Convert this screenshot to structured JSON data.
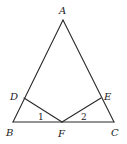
{
  "figure": {
    "type": "geometry-diagram",
    "points": {
      "A": {
        "label": "A"
      },
      "B": {
        "label": "B"
      },
      "C": {
        "label": "C"
      },
      "D": {
        "label": "D"
      },
      "E": {
        "label": "E"
      },
      "F": {
        "label": "F"
      }
    },
    "segments": [
      {
        "name": "AB",
        "from": "A",
        "to": "B"
      },
      {
        "name": "AC",
        "from": "A",
        "to": "C"
      },
      {
        "name": "BC",
        "from": "B",
        "to": "C"
      },
      {
        "name": "DF",
        "from": "D",
        "to": "F"
      },
      {
        "name": "EF",
        "from": "E",
        "to": "F"
      }
    ],
    "angle_marks": [
      {
        "label": "1",
        "vertex": "F",
        "between": [
          "D",
          "B"
        ]
      },
      {
        "label": "2",
        "vertex": "F",
        "between": [
          "E",
          "C"
        ]
      }
    ],
    "stroke_color": "#2a2a2a"
  }
}
